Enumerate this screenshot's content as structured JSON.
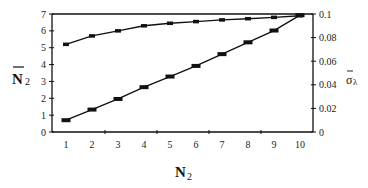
{
  "chart_data": {
    "type": "line",
    "title": "",
    "x": [
      1,
      2,
      3,
      4,
      5,
      6,
      7,
      8,
      9,
      10
    ],
    "xlabel": "N2",
    "ylabel": "N̄2",
    "y2label": "σ̄λ",
    "ylim": [
      0,
      7
    ],
    "y2lim": [
      0,
      0.1
    ],
    "yticks": [
      "0",
      "1",
      "2",
      "3",
      "4",
      "5",
      "6",
      "7"
    ],
    "y2ticks": [
      "0",
      "0.02",
      "0.04",
      "0.06",
      "0.08",
      "0.1"
    ],
    "xticks": [
      "1",
      "2",
      "3",
      "4",
      "5",
      "6",
      "7",
      "8",
      "9",
      "10"
    ],
    "grid": false,
    "legend": null,
    "series": [
      {
        "name": "N̄2 (upper curve)",
        "axis": "left",
        "values": [
          5.2,
          5.7,
          6.0,
          6.3,
          6.45,
          6.55,
          6.65,
          6.72,
          6.8,
          6.9
        ]
      },
      {
        "name": "σ̄λ (lower line)",
        "axis": "right",
        "values": [
          0.01,
          0.019,
          0.028,
          0.038,
          0.047,
          0.056,
          0.066,
          0.076,
          0.086,
          0.099
        ]
      }
    ]
  },
  "labels": {
    "y_main": "N",
    "y_sub": "2",
    "x_main": "N",
    "x_sub": "2",
    "y2_main": "σ",
    "y2_sub": "λ"
  }
}
